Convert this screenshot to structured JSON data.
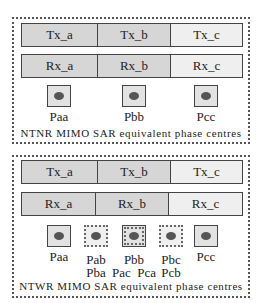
{
  "top_panel": {
    "tx": [
      "Tx_a",
      "Tx_b",
      "Tx_c"
    ],
    "rx": [
      "Rx_a",
      "Rx_b",
      "Rx_c"
    ],
    "phase_centres": [
      {
        "label": "Paa",
        "style": "solid"
      },
      {
        "label": "Pbb",
        "style": "solid"
      },
      {
        "label": "Pcc",
        "style": "solid"
      }
    ],
    "caption": "NTNR MIMO SAR equivalent phase centres"
  },
  "bottom_panel": {
    "tx": [
      "Tx_a",
      "Tx_b",
      "Tx_c"
    ],
    "rx": [
      "Rx_a",
      "Rx_b",
      "Rx_c"
    ],
    "phase_centres": [
      {
        "label": "Paa",
        "label2": "",
        "style": "solid"
      },
      {
        "label": "Pab",
        "label2": "Pba",
        "style": "dashed"
      },
      {
        "label": "Pbb",
        "label2": "Pac  Pca",
        "style": "both"
      },
      {
        "label": "Pbc",
        "label2": "Pcb",
        "style": "dashed"
      },
      {
        "label": "Pcc",
        "label2": "",
        "style": "solid"
      }
    ],
    "caption": "NTWR MIMO SAR equivalent phase centres"
  },
  "colors": {
    "cell_dark": "#d6d6d6",
    "cell_light": "#efefef",
    "dot": "#555555"
  }
}
